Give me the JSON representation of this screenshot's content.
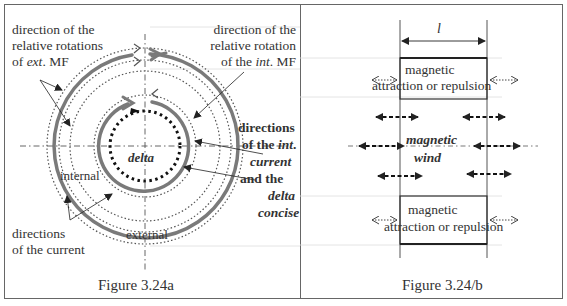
{
  "left_panel": {
    "caption": "Figure 3.24a",
    "labels": {
      "ext_rotation_l1": "direction of the",
      "ext_rotation_l2": "relative rotations",
      "ext_rotation_l3_pre": "of ",
      "ext_rotation_l3_it": "ext",
      "ext_rotation_l3_post": ". MF",
      "int_rotation_l1": "direction of the",
      "int_rotation_l2": "relative rotation",
      "int_rotation_l3_pre": "of the ",
      "int_rotation_l3_it": "int",
      "int_rotation_l3_post": ". MF",
      "int_current_l1": "directions",
      "int_current_l2_pre": "of the ",
      "int_current_l2_it": "int",
      "int_current_l2_post": ".",
      "int_current_l3": "current",
      "int_current_l4": "and the",
      "int_current_l5": "delta",
      "int_current_l6": "concise",
      "delta": "delta",
      "internal": "internal",
      "external": "external",
      "current_l1": "directions",
      "current_l2": "of the current"
    }
  },
  "right_panel": {
    "caption": "Figure 3.24/b",
    "length_symbol": "l",
    "top_block_l1": "magnetic",
    "top_block_l2": "attraction or repulsion",
    "wind_l1": "magnetic",
    "wind_l2": "wind",
    "bottom_block_l1": "magnetic",
    "bottom_block_l2": "attraction or repulsion"
  },
  "colors": {
    "thick_arc": "#777777",
    "dotted": "#555555",
    "border": "#666666",
    "guide": "#cccccc"
  }
}
